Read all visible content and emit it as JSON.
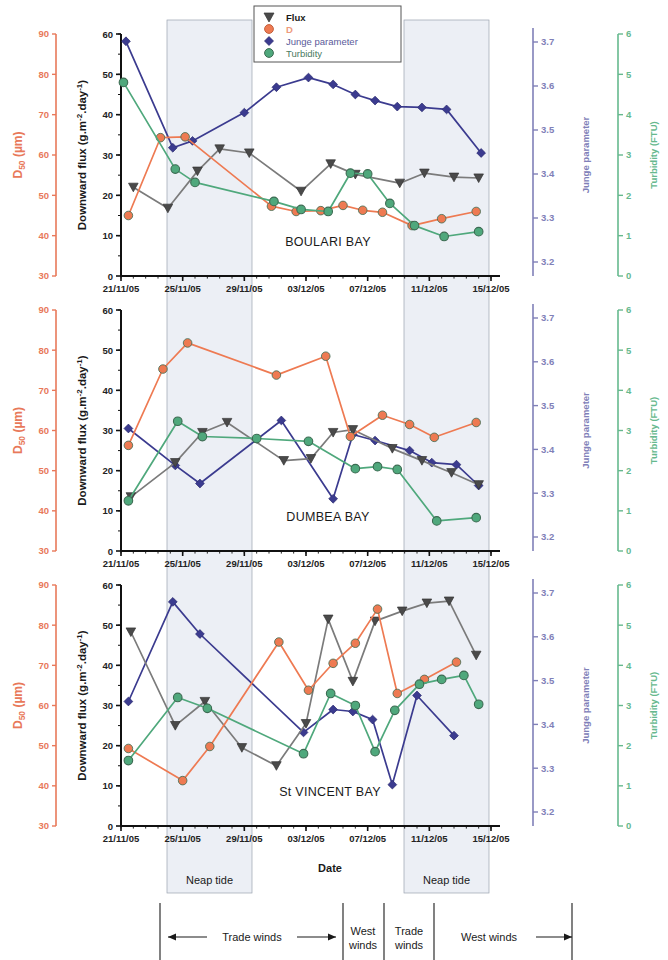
{
  "figure": {
    "xlabel": "Date",
    "x_ticks": [
      "21/11/05",
      "25/11/05",
      "29/11/05",
      "03/12/05",
      "07/12/05",
      "11/12/05",
      "15/12/05"
    ],
    "legend": [
      {
        "label": "Flux",
        "marker": "triangle-down-icon",
        "color": "#555555"
      },
      {
        "label": "D",
        "marker": "circle-icon",
        "color": "#ee7a52"
      },
      {
        "label": "Junge parameter",
        "marker": "diamond-icon",
        "color": "#3b3b8f"
      },
      {
        "label": "Turbidity",
        "marker": "circle-icon",
        "color": "#4fa87c"
      }
    ],
    "axes": {
      "d50": {
        "title": "D50 (µm)",
        "sub": "50",
        "base": "D",
        "unit": "(µm)",
        "ticks": [
          "90",
          "80",
          "70",
          "60",
          "50",
          "40",
          "30"
        ],
        "min": 30,
        "max": 90,
        "color": "#e8795a"
      },
      "flux": {
        "title": "Downward flux (g.m-2.day-1)",
        "ticks": [
          "60",
          "50",
          "40",
          "30",
          "20",
          "10",
          "0"
        ],
        "min": 0,
        "max": 60,
        "color": "#1a1a1a"
      },
      "junge": {
        "title": "Junge parameter",
        "ticks": [
          "3.7",
          "3.6",
          "3.5",
          "3.4",
          "3.3",
          "3.2"
        ],
        "min": 3.15,
        "max": 3.75,
        "color": "#8080b8"
      },
      "turbidity": {
        "title": "Turbidity (FTU)",
        "ticks": [
          "6",
          "5",
          "4",
          "3",
          "2",
          "1",
          "0"
        ],
        "min": 0,
        "max": 6,
        "color": "#66b98e"
      }
    },
    "bands": [
      {
        "label": "Neap tide",
        "start": "23/11/05",
        "end": "27/11/05"
      },
      {
        "label": "Neap tide",
        "start": "07/12/05",
        "end": "11/12/05"
      }
    ],
    "wind_segments": [
      {
        "label": "Trade winds",
        "arrows": "both"
      },
      {
        "label": "West winds",
        "arrows": "none"
      },
      {
        "label": "Trade winds",
        "arrows": "none"
      },
      {
        "label": "West winds",
        "arrows": "right"
      }
    ]
  },
  "chart_data": [
    {
      "type": "line",
      "title": "BOULARI BAY",
      "xlabel": "Date",
      "ylabel": "Downward flux (g.m-2.day-1)",
      "ylim": [
        0,
        60
      ],
      "x": [
        "22/11/05",
        "24/11/05",
        "25/11/05",
        "26/11/05",
        "28/11/05",
        "30/11/05",
        "02/12/05",
        "04/12/05",
        "05/12/05",
        "06/12/05",
        "08/12/05",
        "09/12/05",
        "11/12/05",
        "12/12/05",
        "14/12/05"
      ],
      "series": [
        {
          "name": "Flux",
          "axis": "flux",
          "unit": "g.m-2.day-1",
          "values": [
            22.0,
            16.8,
            null,
            26.0,
            31.5,
            30.5,
            null,
            21.0,
            27.8,
            25.2,
            null,
            23.0,
            25.5,
            24.5,
            24.3
          ],
          "x_positions": [
            0.5,
            1.9,
            null,
            3.1,
            4.0,
            5.2,
            null,
            7.3,
            8.5,
            9.5,
            null,
            11.3,
            12.3,
            13.5,
            14.5
          ]
        },
        {
          "name": "D",
          "axis": "d50",
          "unit": "µm",
          "values": [
            15.0,
            34.3,
            34.5,
            null,
            null,
            null,
            17.3,
            16.0,
            16.2,
            17.5,
            16.3,
            15.8,
            12.5,
            14.2,
            16.0
          ],
          "x_positions": [
            0.3,
            1.6,
            2.6,
            null,
            null,
            null,
            6.1,
            7.1,
            8.1,
            9.0,
            9.8,
            10.6,
            11.8,
            13.0,
            14.4
          ]
        },
        {
          "name": "Junge parameter",
          "axis": "junge",
          "unit": "",
          "values": [
            58.2,
            31.8,
            33.5,
            null,
            null,
            40.5,
            46.8,
            49.2,
            47.5,
            45.0,
            43.5,
            42.0,
            41.8,
            41.3,
            30.5
          ],
          "x_positions": [
            0.2,
            2.1,
            2.9,
            null,
            null,
            5.0,
            6.3,
            7.6,
            8.6,
            9.5,
            10.3,
            11.2,
            12.2,
            13.2,
            14.6
          ]
        },
        {
          "name": "Turbidity",
          "axis": "turbidity",
          "unit": "FTU",
          "values": [
            48.0,
            26.5,
            23.2,
            null,
            null,
            null,
            18.5,
            16.5,
            16.0,
            25.5,
            25.3,
            18.0,
            12.5,
            9.8,
            11.0
          ],
          "x_positions": [
            0.1,
            2.2,
            3.0,
            null,
            null,
            null,
            6.2,
            7.3,
            8.4,
            9.3,
            10.0,
            10.9,
            11.9,
            13.1,
            14.5
          ]
        }
      ]
    },
    {
      "type": "line",
      "title": "DUMBEA BAY",
      "xlabel": "Date",
      "ylabel": "Downward flux (g.m-2.day-1)",
      "ylim": [
        0,
        60
      ],
      "x": [
        "22/11/05",
        "24/11/05",
        "25/11/05",
        "26/11/05",
        "28/11/05",
        "30/11/05",
        "02/12/05",
        "04/12/05",
        "05/12/05",
        "06/12/05",
        "08/12/05",
        "09/12/05",
        "11/12/05",
        "12/12/05",
        "14/12/05"
      ],
      "series": [
        {
          "name": "Flux",
          "axis": "flux",
          "unit": "g.m-2.day-1",
          "values": [
            13.5,
            22.0,
            29.5,
            32.0,
            null,
            22.5,
            null,
            23.0,
            29.5,
            30.2,
            null,
            25.5,
            22.5,
            19.5,
            16.5
          ],
          "x_positions": [
            0.4,
            2.2,
            3.3,
            4.3,
            null,
            6.6,
            null,
            7.7,
            8.6,
            9.4,
            null,
            11.0,
            12.2,
            13.4,
            14.5
          ]
        },
        {
          "name": "D",
          "axis": "d50",
          "unit": "µm",
          "values": [
            26.3,
            45.3,
            51.8,
            null,
            null,
            43.8,
            null,
            48.5,
            28.5,
            null,
            33.8,
            31.5,
            28.3,
            32.0,
            null
          ],
          "x_positions": [
            0.3,
            1.7,
            2.7,
            null,
            null,
            6.3,
            null,
            8.3,
            9.3,
            null,
            10.6,
            11.7,
            12.7,
            14.4,
            null
          ]
        },
        {
          "name": "Junge parameter",
          "axis": "junge",
          "unit": "",
          "values": [
            30.5,
            21.3,
            16.8,
            null,
            null,
            32.5,
            null,
            13.0,
            29.0,
            27.5,
            null,
            25.0,
            22.0,
            21.5,
            16.3
          ],
          "x_positions": [
            0.3,
            2.2,
            3.2,
            null,
            null,
            6.5,
            null,
            8.6,
            9.4,
            10.3,
            null,
            11.7,
            12.6,
            13.6,
            14.5
          ]
        },
        {
          "name": "Turbidity",
          "axis": "turbidity",
          "unit": "FTU",
          "values": [
            12.5,
            32.3,
            28.5,
            null,
            28.0,
            null,
            27.3,
            null,
            20.5,
            21.0,
            20.3,
            null,
            7.5,
            8.3,
            null
          ],
          "x_positions": [
            0.3,
            2.3,
            3.3,
            null,
            5.5,
            null,
            7.6,
            null,
            9.5,
            10.4,
            11.2,
            null,
            12.8,
            14.4,
            null
          ]
        }
      ]
    },
    {
      "type": "line",
      "title": "St VINCENT BAY",
      "xlabel": "Date",
      "ylabel": "Downward flux (g.m-2.day-1)",
      "ylim": [
        0,
        60
      ],
      "x": [
        "22/11/05",
        "24/11/05",
        "25/11/05",
        "26/11/05",
        "28/11/05",
        "30/11/05",
        "02/12/05",
        "04/12/05",
        "05/12/05",
        "06/12/05",
        "08/12/05",
        "09/12/05",
        "11/12/05",
        "12/12/05",
        "14/12/05"
      ],
      "series": [
        {
          "name": "Flux",
          "axis": "flux",
          "unit": "g.m-2.day-1",
          "values": [
            48.3,
            25.0,
            31.0,
            19.5,
            15.0,
            25.5,
            51.5,
            36.0,
            51.0,
            53.5,
            55.5,
            56.0,
            42.5,
            null,
            null
          ],
          "x_positions": [
            0.4,
            2.2,
            3.4,
            4.9,
            6.3,
            7.5,
            8.4,
            9.4,
            10.3,
            11.4,
            12.4,
            13.3,
            14.4,
            null,
            null
          ]
        },
        {
          "name": "D",
          "axis": "d50",
          "unit": "µm",
          "values": [
            19.3,
            11.3,
            19.8,
            null,
            45.8,
            33.8,
            40.5,
            45.5,
            54.0,
            33.0,
            36.5,
            40.8,
            null,
            null,
            null
          ],
          "x_positions": [
            0.3,
            2.5,
            3.6,
            null,
            6.4,
            7.6,
            8.6,
            9.5,
            10.4,
            11.2,
            12.3,
            13.6,
            null,
            null,
            null
          ]
        },
        {
          "name": "Junge parameter",
          "axis": "junge",
          "unit": "",
          "values": [
            31.0,
            55.8,
            47.8,
            null,
            23.3,
            29.0,
            28.5,
            26.5,
            10.3,
            32.5,
            null,
            22.5,
            null,
            null,
            null
          ],
          "x_positions": [
            0.3,
            2.1,
            3.2,
            null,
            7.4,
            8.6,
            9.4,
            10.2,
            11.0,
            12.0,
            null,
            13.5,
            null,
            null,
            null
          ]
        },
        {
          "name": "Turbidity",
          "axis": "turbidity",
          "unit": "FTU",
          "values": [
            16.3,
            32.0,
            29.3,
            null,
            18.0,
            33.0,
            30.0,
            18.5,
            28.8,
            35.3,
            36.5,
            37.5,
            30.3,
            null,
            null
          ],
          "x_positions": [
            0.3,
            2.3,
            3.5,
            null,
            7.4,
            8.5,
            9.5,
            10.3,
            11.1,
            12.1,
            13.0,
            13.9,
            14.5,
            null,
            null
          ]
        }
      ]
    }
  ]
}
